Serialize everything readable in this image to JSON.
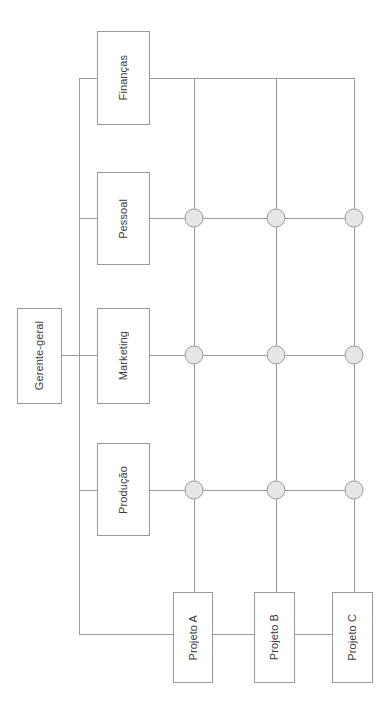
{
  "diagram": {
    "type": "matrix-organizational-chart",
    "orientation": "rotated-90-counterclockwise",
    "canvas": {
      "width": 391,
      "height": 703
    },
    "colors": {
      "background": "#ffffff",
      "box_border": "#9a9a9a",
      "box_fill": "#ffffff",
      "line": "#9a9a9a",
      "node_fill": "#e6e6e6",
      "node_stroke": "#9a9a9a",
      "text": "#3c3c3c"
    },
    "executive": {
      "label": "Gerente-geral",
      "x": 17,
      "y": 308,
      "w": 45,
      "h": 96
    },
    "departments": [
      {
        "label": "Finanças",
        "x": 97,
        "y": 31,
        "w": 53,
        "h": 94,
        "row_y": 78
      },
      {
        "label": "Pessoal",
        "x": 97,
        "y": 172,
        "w": 53,
        "h": 93,
        "row_y": 218
      },
      {
        "label": "Marketing",
        "x": 97,
        "y": 308,
        "w": 53,
        "h": 96,
        "row_y": 355
      },
      {
        "label": "Produção",
        "x": 97,
        "y": 443,
        "w": 53,
        "h": 93,
        "row_y": 490
      }
    ],
    "projects": [
      {
        "label": "Projeto A",
        "x": 173,
        "y": 592,
        "w": 40,
        "h": 91,
        "col_x": 194
      },
      {
        "label": "Projeto B",
        "x": 254,
        "y": 592,
        "w": 41,
        "h": 91,
        "col_x": 276
      },
      {
        "label": "Projeto C",
        "x": 332,
        "y": 592,
        "w": 41,
        "h": 91,
        "col_x": 354
      }
    ],
    "nodes": [
      {
        "id": "node-pessoal-projeto-a",
        "department": "Pessoal",
        "project": "Projeto A",
        "cx": 194,
        "cy": 218,
        "r": 9
      },
      {
        "id": "node-pessoal-projeto-b",
        "department": "Pessoal",
        "project": "Projeto B",
        "cx": 276,
        "cy": 218,
        "r": 9
      },
      {
        "id": "node-pessoal-projeto-c",
        "department": "Pessoal",
        "project": "Projeto C",
        "cx": 354,
        "cy": 218,
        "r": 9
      },
      {
        "id": "node-marketing-projeto-a",
        "department": "Marketing",
        "project": "Projeto A",
        "cx": 194,
        "cy": 355,
        "r": 9
      },
      {
        "id": "node-marketing-projeto-b",
        "department": "Marketing",
        "project": "Projeto B",
        "cx": 276,
        "cy": 355,
        "r": 9
      },
      {
        "id": "node-marketing-projeto-c",
        "department": "Marketing",
        "project": "Projeto C",
        "cx": 354,
        "cy": 355,
        "r": 9
      },
      {
        "id": "node-producao-projeto-a",
        "department": "Produção",
        "project": "Projeto A",
        "cx": 194,
        "cy": 490,
        "r": 9
      },
      {
        "id": "node-producao-projeto-b",
        "department": "Produção",
        "project": "Projeto B",
        "cx": 276,
        "cy": 490,
        "r": 9
      },
      {
        "id": "node-producao-projeto-c",
        "department": "Produção",
        "project": "Projeto C",
        "cx": 354,
        "cy": 490,
        "r": 9
      }
    ],
    "geometry": {
      "trunk_x": 79,
      "trunk_top_y": 78,
      "trunk_bottom_y": 634,
      "exec_connector_y": 355,
      "exec_connector_x1": 62,
      "exec_connector_x2": 97,
      "dept_right_x": 150,
      "grid_right_x": 354,
      "projects_link_y": 634,
      "project_link_x1": 79,
      "project_link_x2": 194
    }
  }
}
